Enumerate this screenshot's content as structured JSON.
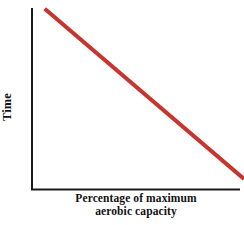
{
  "chart_data": {
    "type": "line",
    "title": "",
    "subtitle": "",
    "xlabel_line1": "Percentage of maximum",
    "xlabel_line2": "aerobic capacity",
    "xlabel": "Percentage of maximum aerobic capacity",
    "ylabel": "Time",
    "xlim": [
      0,
      100
    ],
    "ylim": [
      0,
      100
    ],
    "grid": false,
    "legend": "none",
    "xticks": [],
    "yticks": [],
    "xticklabels": [],
    "yticklabels": [],
    "series": [
      {
        "name": "Time vs percentage of maximum aerobic capacity",
        "color": "#c8342e",
        "linewidth": 4,
        "x": [
          6,
          100
        ],
        "y": [
          98,
          6
        ],
        "points": [
          {
            "x": 6,
            "y": 98
          },
          {
            "x": 100,
            "y": 6
          }
        ]
      }
    ],
    "annotations": [],
    "axes": {
      "spines": [
        "left",
        "bottom"
      ],
      "spine_color": "#1a1a1a",
      "spine_width": 2,
      "arrowheads": false,
      "ticks_visible": false
    },
    "background_color": "#ffffff"
  }
}
